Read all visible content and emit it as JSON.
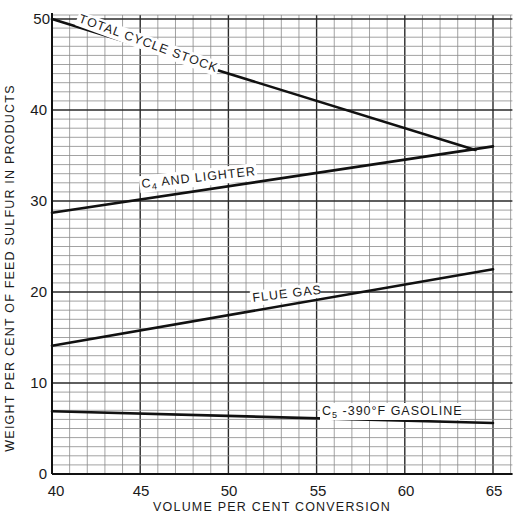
{
  "chart_data": {
    "type": "line",
    "title": "",
    "xlabel": "VOLUME PER CENT CONVERSION",
    "ylabel": "WEIGHT PER CENT OF FEED SULFUR IN PRODUCTS",
    "xlim": [
      40,
      65
    ],
    "ylim": [
      0,
      50
    ],
    "x_ticks": [
      40,
      45,
      50,
      55,
      60,
      65
    ],
    "y_ticks": [
      0,
      10,
      20,
      30,
      40,
      50
    ],
    "grid": true,
    "grid_minor_step_x": 1,
    "grid_minor_step_y": 1,
    "legend": "inline labels",
    "series": [
      {
        "name": "TOTAL CYCLE STOCK",
        "x": [
          40,
          64
        ],
        "y": [
          50.0,
          35.6
        ]
      },
      {
        "name": "C4 AND LIGHTER",
        "x": [
          40,
          65
        ],
        "y": [
          28.7,
          36.0
        ]
      },
      {
        "name": "FLUE GAS",
        "x": [
          40,
          65
        ],
        "y": [
          14.1,
          22.5
        ]
      },
      {
        "name": "C5-390°F GASOLINE",
        "x": [
          40,
          65
        ],
        "y": [
          6.9,
          5.6
        ]
      }
    ]
  },
  "labels": {
    "xlabel": "VOLUME PER CENT CONVERSION",
    "ylabel": "WEIGHT PER CENT OF FEED SULFUR IN PRODUCTS",
    "x_ticks": [
      "40",
      "45",
      "50",
      "55",
      "60",
      "65"
    ],
    "y_ticks": [
      "0",
      "10",
      "20",
      "30",
      "40",
      "50"
    ],
    "series": {
      "total_cycle_stock": "TOTAL CYCLE STOCK",
      "c4_prefix": "C",
      "c4_sub": "4",
      "c4_rest": " AND LIGHTER",
      "flue_gas": "FLUE GAS",
      "c5_prefix": "C",
      "c5_sub": "5",
      "c5_rest": " -390°F GASOLINE"
    }
  }
}
